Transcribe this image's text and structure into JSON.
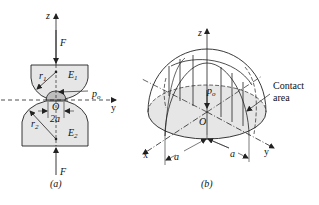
{
  "figure": {
    "panel_a": {
      "caption": "(a)",
      "labels": {
        "z_axis": "z",
        "y_axis": "y",
        "force_top": "F",
        "force_bottom": "F",
        "radius_top": "r",
        "radius_top_sub": "1",
        "radius_bottom": "r",
        "radius_bottom_sub": "2",
        "modulus_top": "E",
        "modulus_top_sub": "1",
        "modulus_bottom": "E",
        "modulus_bottom_sub": "2",
        "pressure": "p",
        "pressure_sub": "o",
        "origin": "O",
        "width": "2a"
      }
    },
    "panel_b": {
      "caption": "(b)",
      "labels": {
        "z_axis": "z",
        "x_axis": "x",
        "y_axis": "y",
        "pressure": "p",
        "pressure_sub": "o",
        "origin": "O",
        "radius_left": "a",
        "radius_right": "a",
        "contact_area_line1": "Contact",
        "contact_area_line2": "area"
      }
    },
    "colors": {
      "stroke": "#222222",
      "fill_body": "#e6e6e6",
      "fill_contact": "#bdbdbd",
      "background": "#ffffff"
    }
  }
}
